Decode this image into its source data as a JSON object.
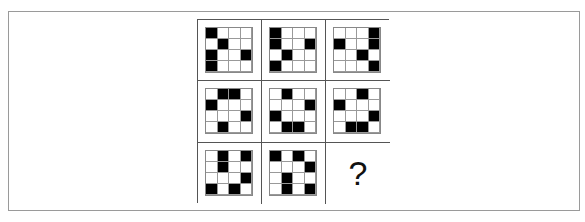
{
  "puzzle": {
    "rows": 3,
    "cols": 3,
    "cells": [
      {
        "pattern": [
          "1000",
          "0100",
          "1001",
          "1000"
        ]
      },
      {
        "pattern": [
          "1000",
          "1001",
          "0100",
          "1000"
        ]
      },
      {
        "pattern": [
          "0001",
          "1001",
          "0010",
          "0001"
        ]
      },
      {
        "pattern": [
          "0110",
          "1000",
          "0001",
          "0100"
        ]
      },
      {
        "pattern": [
          "0100",
          "0001",
          "1000",
          "0110"
        ]
      },
      {
        "pattern": [
          "0010",
          "1000",
          "0001",
          "0110"
        ]
      },
      {
        "pattern": [
          "0101",
          "0100",
          "0001",
          "1010"
        ]
      },
      {
        "pattern": [
          "1010",
          "0001",
          "0100",
          "0101"
        ]
      },
      {
        "pattern": null,
        "label": "?"
      }
    ]
  },
  "colors": {
    "filled": "#000000",
    "empty": "#ffffff",
    "grid_line": "#555555"
  }
}
